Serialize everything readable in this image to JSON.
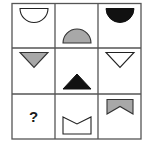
{
  "puzzle": {
    "rows": 3,
    "cols": 3,
    "grid_color": "#555555",
    "cells": [
      {
        "row": 0,
        "col": 0,
        "shape": "semicircle-down",
        "fill": "white",
        "position": "top"
      },
      {
        "row": 0,
        "col": 1,
        "shape": "semicircle-up",
        "fill": "gray",
        "position": "bottom"
      },
      {
        "row": 0,
        "col": 2,
        "shape": "semicircle-down",
        "fill": "black",
        "position": "top"
      },
      {
        "row": 1,
        "col": 0,
        "shape": "triangle-down",
        "fill": "gray",
        "position": "top"
      },
      {
        "row": 1,
        "col": 1,
        "shape": "triangle-up",
        "fill": "black",
        "position": "bottom"
      },
      {
        "row": 1,
        "col": 2,
        "shape": "triangle-down",
        "fill": "white",
        "position": "top"
      },
      {
        "row": 2,
        "col": 0,
        "shape": "unknown",
        "label": "?"
      },
      {
        "row": 2,
        "col": 1,
        "shape": "notched-rect-top",
        "fill": "white",
        "position": "bottom"
      },
      {
        "row": 2,
        "col": 2,
        "shape": "notched-rect-bottom",
        "fill": "gray",
        "position": "top"
      }
    ],
    "missing_label": "?",
    "colors": {
      "white": "#ffffff",
      "gray": "#a8a8a8",
      "black": "#111111",
      "stroke": "#222222"
    }
  }
}
